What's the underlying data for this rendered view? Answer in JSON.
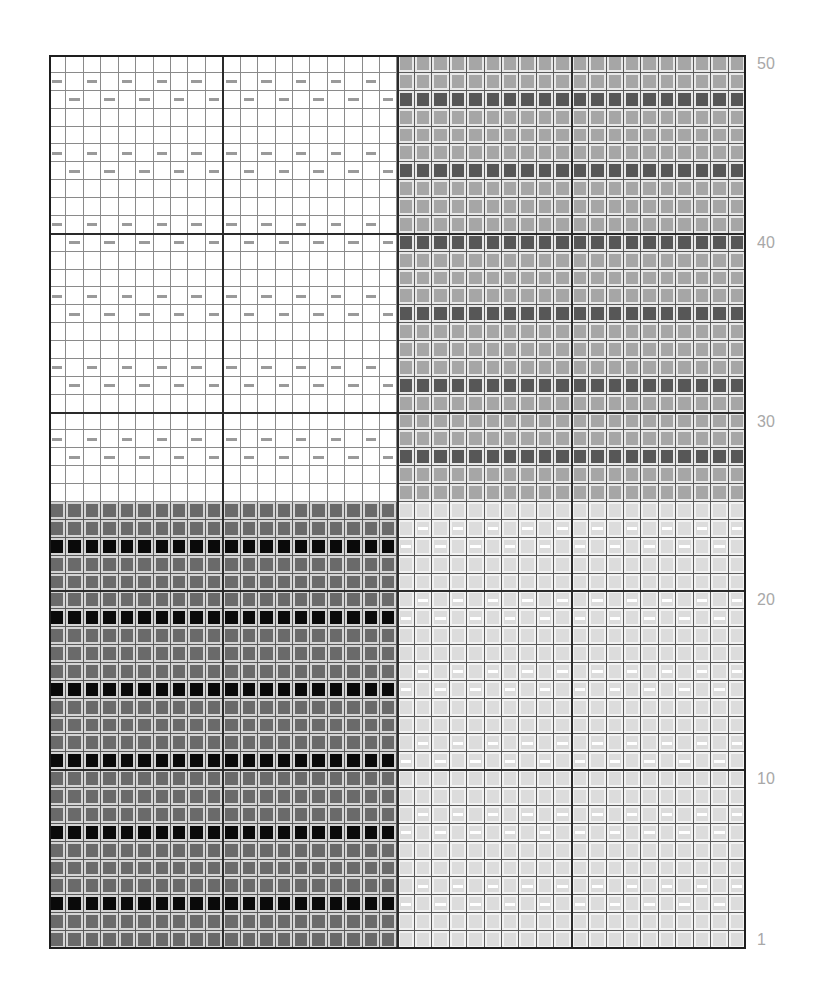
{
  "chart": {
    "title": "",
    "columns": 40,
    "rows": 50,
    "major_grid_every": 10,
    "row_labels": [
      {
        "row": 50,
        "text": "50"
      },
      {
        "row": 40,
        "text": "40"
      },
      {
        "row": 30,
        "text": "30"
      },
      {
        "row": 20,
        "text": "20"
      },
      {
        "row": 10,
        "text": "10"
      },
      {
        "row": 1,
        "text": "1"
      }
    ],
    "colors": {
      "white": "#ffffff",
      "mid_gray": "#a6a6a6",
      "mid_dark_stripe": "#575757",
      "dark_gray": "#6a6a6a",
      "black_stripe": "#0a0a0a",
      "light_gray": "#dcdcdc",
      "gray_dash": "#9a9a9a",
      "white_dash": "#ffffff",
      "grid_line": "#5a5a5a",
      "label": "#a8a8a8"
    },
    "blocks": [
      {
        "name": "top-left",
        "cols": [
          1,
          20
        ],
        "rows": [
          26,
          50
        ],
        "base": "white",
        "stripe_rows": [],
        "dash": "gray",
        "dash_rows_odd_cols": [
          49,
          45,
          41,
          37,
          33,
          29
        ],
        "dash_rows_even_cols": [
          48,
          44,
          40,
          36,
          32,
          28
        ]
      },
      {
        "name": "top-right",
        "cols": [
          21,
          40
        ],
        "rows": [
          26,
          50
        ],
        "base": "mid",
        "stripe": "middark",
        "stripe_rows": [
          48,
          44,
          40,
          36,
          32,
          28
        ],
        "dash": null,
        "dash_rows_odd_cols": [],
        "dash_rows_even_cols": []
      },
      {
        "name": "bottom-left",
        "cols": [
          1,
          20
        ],
        "rows": [
          1,
          25
        ],
        "base": "dark",
        "stripe": "black",
        "stripe_rows": [
          23,
          19,
          15,
          11,
          7,
          3
        ],
        "dash": null,
        "dash_rows_odd_cols": [],
        "dash_rows_even_cols": []
      },
      {
        "name": "bottom-right",
        "cols": [
          21,
          40
        ],
        "rows": [
          1,
          25
        ],
        "base": "light",
        "stripe_rows": [],
        "dash": "white",
        "dash_rows_odd_cols": [
          23,
          19,
          15,
          11,
          7,
          3
        ],
        "dash_rows_even_cols": [
          24,
          20,
          16,
          12,
          8,
          4
        ]
      }
    ]
  }
}
